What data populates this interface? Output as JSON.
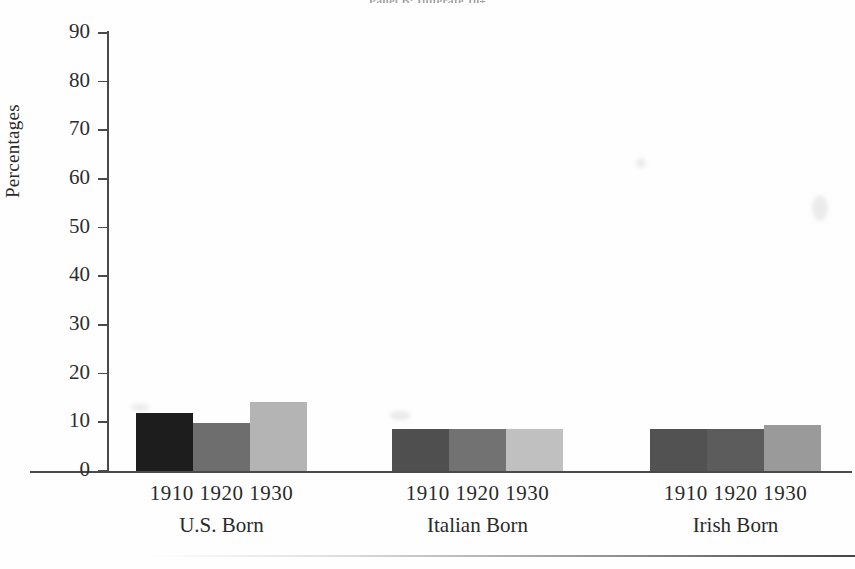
{
  "figure": {
    "title_partial": "Panel B: Illiterate 10+",
    "background_color": "#fefefe",
    "axis_color": "#4a4a4a"
  },
  "chart_data": {
    "type": "bar",
    "title": "Panel B: Illiterate 10+",
    "xlabel": "",
    "ylabel": "Percentages",
    "ylim": [
      0,
      90
    ],
    "ytick_interval": 10,
    "yticks": [
      90,
      80,
      70,
      60,
      50,
      40,
      30,
      20,
      10,
      0
    ],
    "grid": false,
    "legend": "none",
    "categories": [
      "U.S. Born",
      "Italian Born",
      "Irish Born"
    ],
    "subcategories": [
      "1910",
      "1920",
      "1930"
    ],
    "series": [
      {
        "name": "1910",
        "color": "#1d1d1d",
        "values": [
          12.0,
          8.6,
          8.6
        ]
      },
      {
        "name": "1920",
        "color": "#6e6e6e",
        "values": [
          9.8,
          8.6,
          8.6
        ]
      },
      {
        "name": "1930",
        "color": "#b4b4b4",
        "values": [
          14.1,
          8.6,
          9.5
        ]
      }
    ],
    "group_colors": [
      [
        "#1d1d1d",
        "#6e6e6e",
        "#b4b4b4"
      ],
      [
        "#4f4f4f",
        "#727272",
        "#c0c0c0"
      ],
      [
        "#525252",
        "#5c5c5c",
        "#9a9a9a"
      ]
    ]
  },
  "yaxis": {
    "label": "Percentages",
    "ticks": [
      "90",
      "80",
      "70",
      "60",
      "50",
      "40",
      "30",
      "20",
      "10",
      "0"
    ]
  },
  "groups": [
    {
      "name": "U.S. Born",
      "tick_row": "1910 1920 1930",
      "bars": [
        {
          "year": "1910",
          "value": 12.0,
          "color": "#1d1d1d"
        },
        {
          "year": "1920",
          "value": 9.8,
          "color": "#6e6e6e"
        },
        {
          "year": "1930",
          "value": 14.1,
          "color": "#b4b4b4"
        }
      ]
    },
    {
      "name": "Italian Born",
      "tick_row": "1910 1920 1930",
      "bars": [
        {
          "year": "1910",
          "value": 8.6,
          "color": "#4f4f4f"
        },
        {
          "year": "1920",
          "value": 8.6,
          "color": "#727272"
        },
        {
          "year": "1930",
          "value": 8.6,
          "color": "#c0c0c0"
        }
      ]
    },
    {
      "name": "Irish Born",
      "tick_row": "1910 1920 1930",
      "bars": [
        {
          "year": "1910",
          "value": 8.6,
          "color": "#525252"
        },
        {
          "year": "1920",
          "value": 8.6,
          "color": "#5c5c5c"
        },
        {
          "year": "1930",
          "value": 9.5,
          "color": "#9a9a9a"
        }
      ]
    }
  ]
}
